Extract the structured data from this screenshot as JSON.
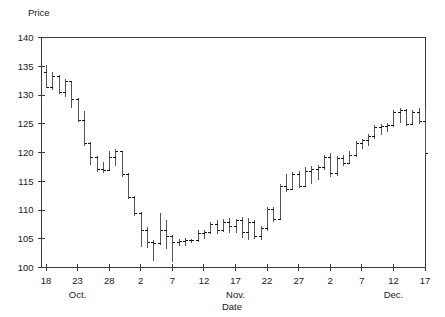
{
  "chart_data": {
    "type": "ohlc",
    "title": "",
    "ylabel": "Price",
    "xlabel": "Date",
    "ylim": [
      100,
      140
    ],
    "yticks": [
      100,
      105,
      110,
      115,
      120,
      125,
      130,
      135,
      140
    ],
    "grid": false,
    "legend": null,
    "xticks": [
      {
        "label": "18",
        "index": 0
      },
      {
        "label": "23",
        "index": 5
      },
      {
        "label": "28",
        "index": 10
      },
      {
        "label": "2",
        "index": 15
      },
      {
        "label": "7",
        "index": 20
      },
      {
        "label": "12",
        "index": 25
      },
      {
        "label": "17",
        "index": 30
      },
      {
        "label": "22",
        "index": 35
      },
      {
        "label": "27",
        "index": 40
      },
      {
        "label": "2",
        "index": 45
      },
      {
        "label": "7",
        "index": 50
      },
      {
        "label": "12",
        "index": 55
      },
      {
        "label": "17",
        "index": 60
      }
    ],
    "month_labels": [
      {
        "label": "Oct.",
        "index": 5
      },
      {
        "label": "Nov.",
        "index": 30
      },
      {
        "label": "Dec.",
        "index": 55
      }
    ],
    "series_name": "Price",
    "bars": [
      {
        "open": 134.0,
        "high": 135.2,
        "low": 131.2,
        "close": 131.4
      },
      {
        "open": 131.4,
        "high": 134.0,
        "low": 130.8,
        "close": 133.3
      },
      {
        "open": 133.3,
        "high": 133.4,
        "low": 130.2,
        "close": 130.5
      },
      {
        "open": 130.5,
        "high": 132.7,
        "low": 129.6,
        "close": 132.4
      },
      {
        "open": 132.4,
        "high": 132.5,
        "low": 127.8,
        "close": 129.3
      },
      {
        "open": 129.3,
        "high": 129.4,
        "low": 125.3,
        "close": 125.6
      },
      {
        "open": 125.6,
        "high": 127.2,
        "low": 121.2,
        "close": 121.6
      },
      {
        "open": 121.6,
        "high": 121.8,
        "low": 117.9,
        "close": 119.2
      },
      {
        "open": 119.2,
        "high": 119.4,
        "low": 116.6,
        "close": 117.1
      },
      {
        "open": 117.1,
        "high": 118.4,
        "low": 116.5,
        "close": 117.0
      },
      {
        "open": 117.0,
        "high": 120.2,
        "low": 116.8,
        "close": 119.3
      },
      {
        "open": 119.3,
        "high": 120.6,
        "low": 117.6,
        "close": 120.2
      },
      {
        "open": 120.2,
        "high": 120.3,
        "low": 115.8,
        "close": 116.2
      },
      {
        "open": 116.2,
        "high": 116.4,
        "low": 112.0,
        "close": 112.3
      },
      {
        "open": 112.3,
        "high": 112.5,
        "low": 109.0,
        "close": 109.4
      },
      {
        "open": 109.4,
        "high": 109.6,
        "low": 103.6,
        "close": 106.6
      },
      {
        "open": 106.6,
        "high": 107.0,
        "low": 103.4,
        "close": 104.4
      },
      {
        "open": 104.4,
        "high": 104.8,
        "low": 101.2,
        "close": 104.3
      },
      {
        "open": 104.3,
        "high": 109.4,
        "low": 104.0,
        "close": 106.6
      },
      {
        "open": 106.6,
        "high": 108.2,
        "low": 103.2,
        "close": 105.4
      },
      {
        "open": 105.4,
        "high": 105.6,
        "low": 101.0,
        "close": 104.5
      },
      {
        "open": 104.5,
        "high": 105.0,
        "low": 103.8,
        "close": 104.6
      },
      {
        "open": 104.6,
        "high": 105.2,
        "low": 103.8,
        "close": 104.8
      },
      {
        "open": 104.8,
        "high": 105.0,
        "low": 104.2,
        "close": 104.7
      },
      {
        "open": 104.7,
        "high": 106.6,
        "low": 104.4,
        "close": 106.0
      },
      {
        "open": 106.0,
        "high": 106.6,
        "low": 104.9,
        "close": 106.2
      },
      {
        "open": 106.2,
        "high": 107.9,
        "low": 105.9,
        "close": 107.6
      },
      {
        "open": 107.6,
        "high": 108.2,
        "low": 105.8,
        "close": 106.6
      },
      {
        "open": 106.6,
        "high": 108.4,
        "low": 106.2,
        "close": 108.0
      },
      {
        "open": 108.0,
        "high": 108.6,
        "low": 106.0,
        "close": 107.2
      },
      {
        "open": 107.2,
        "high": 108.4,
        "low": 106.0,
        "close": 108.2
      },
      {
        "open": 108.2,
        "high": 108.8,
        "low": 105.2,
        "close": 106.2
      },
      {
        "open": 106.2,
        "high": 108.6,
        "low": 104.8,
        "close": 107.9
      },
      {
        "open": 107.9,
        "high": 108.2,
        "low": 105.0,
        "close": 105.4
      },
      {
        "open": 105.4,
        "high": 107.2,
        "low": 104.8,
        "close": 106.8
      },
      {
        "open": 106.8,
        "high": 110.6,
        "low": 106.4,
        "close": 110.2
      },
      {
        "open": 110.2,
        "high": 110.6,
        "low": 108.0,
        "close": 108.4
      },
      {
        "open": 108.4,
        "high": 114.6,
        "low": 108.2,
        "close": 114.2
      },
      {
        "open": 114.2,
        "high": 116.2,
        "low": 113.2,
        "close": 113.6
      },
      {
        "open": 113.6,
        "high": 116.6,
        "low": 113.4,
        "close": 116.2
      },
      {
        "open": 116.2,
        "high": 116.8,
        "low": 113.8,
        "close": 114.2
      },
      {
        "open": 114.2,
        "high": 117.4,
        "low": 114.0,
        "close": 116.8
      },
      {
        "open": 116.8,
        "high": 117.6,
        "low": 114.6,
        "close": 117.2
      },
      {
        "open": 117.2,
        "high": 117.8,
        "low": 115.2,
        "close": 117.4
      },
      {
        "open": 117.4,
        "high": 119.6,
        "low": 117.0,
        "close": 119.2
      },
      {
        "open": 119.2,
        "high": 120.0,
        "low": 115.8,
        "close": 116.4
      },
      {
        "open": 116.4,
        "high": 119.4,
        "low": 116.0,
        "close": 119.0
      },
      {
        "open": 119.0,
        "high": 119.6,
        "low": 117.6,
        "close": 118.2
      },
      {
        "open": 118.2,
        "high": 120.2,
        "low": 118.0,
        "close": 119.6
      },
      {
        "open": 119.6,
        "high": 122.0,
        "low": 119.2,
        "close": 121.6
      },
      {
        "open": 121.6,
        "high": 122.4,
        "low": 120.6,
        "close": 122.2
      },
      {
        "open": 122.2,
        "high": 123.2,
        "low": 121.2,
        "close": 122.8
      },
      {
        "open": 122.8,
        "high": 124.8,
        "low": 122.4,
        "close": 124.4
      },
      {
        "open": 124.4,
        "high": 125.0,
        "low": 123.0,
        "close": 124.6
      },
      {
        "open": 124.6,
        "high": 125.2,
        "low": 123.6,
        "close": 124.8
      },
      {
        "open": 124.8,
        "high": 127.4,
        "low": 124.4,
        "close": 127.0
      },
      {
        "open": 127.0,
        "high": 127.8,
        "low": 125.2,
        "close": 127.4
      },
      {
        "open": 127.4,
        "high": 127.6,
        "low": 124.6,
        "close": 125.0
      },
      {
        "open": 125.0,
        "high": 127.4,
        "low": 124.8,
        "close": 127.0
      },
      {
        "open": 127.0,
        "high": 127.8,
        "low": 125.0,
        "close": 125.4
      },
      {
        "open": 125.4,
        "high": 127.6,
        "low": 119.6,
        "close": 120.0
      }
    ]
  }
}
